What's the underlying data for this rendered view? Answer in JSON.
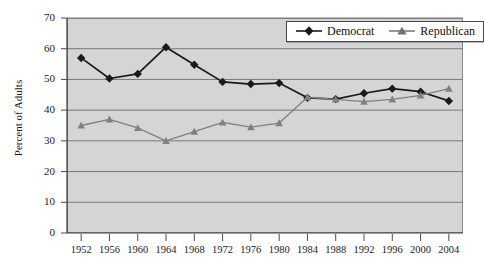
{
  "chart_data": {
    "type": "line",
    "title": "",
    "subtitle": "",
    "xlabel": "",
    "ylabel": "Percent of Adults",
    "ylim": [
      0,
      70
    ],
    "ytick_step": 10,
    "grid": true,
    "legend_position": "top-right",
    "plot_background": "#d5d5d5",
    "categories": [
      "1952",
      "1956",
      "1960",
      "1964",
      "1968",
      "1972",
      "1976",
      "1980",
      "1984",
      "1988",
      "1992",
      "1996",
      "2000",
      "2004"
    ],
    "yticks": [
      "0",
      "10",
      "20",
      "30",
      "40",
      "50",
      "60",
      "70"
    ],
    "series": [
      {
        "name": "Democrat",
        "marker": "diamond",
        "color": "#1a1a1a",
        "values": [
          57,
          50.3,
          51.8,
          60.5,
          54.8,
          49.2,
          48.5,
          48.8,
          44,
          43.6,
          45.5,
          47,
          46,
          43
        ]
      },
      {
        "name": "Republican",
        "marker": "triangle",
        "color": "#808080",
        "values": [
          35,
          37,
          34.2,
          30,
          33,
          36,
          34.5,
          35.8,
          44.2,
          43.5,
          42.8,
          43.5,
          44.8,
          47
        ]
      }
    ]
  },
  "legend": {
    "items": [
      {
        "label": "Democrat"
      },
      {
        "label": "Republican"
      }
    ]
  },
  "axes": {
    "y_title": "Percent of Adults"
  }
}
